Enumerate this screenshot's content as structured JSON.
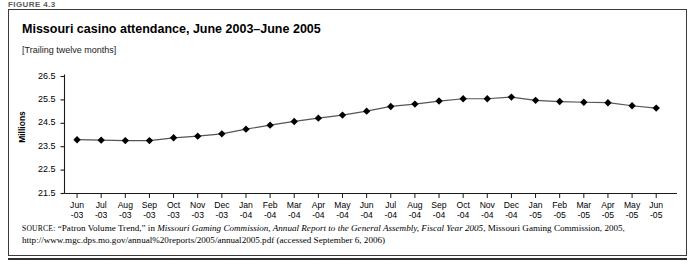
{
  "figure": {
    "label": "FIGURE 4.3"
  },
  "chart_header": {
    "title": "Missouri casino attendance, June 2003–June 2005",
    "subtitle": "[Trailing twelve months]"
  },
  "source": {
    "source_word": "SOURCE:",
    "part1": " “Patron Volume Trend,” in ",
    "italic1": "Missouri Gaming Commission, Annual Report to the General Assembly, Fiscal Year 2005",
    "part2": ", Missouri Gaming Commission, 2005, http://www.mgc.dps.mo.gov/annual%20reports/2005/annual2005.pdf (accessed September 6, 2006)"
  },
  "chart_data": {
    "type": "line",
    "title": "Missouri casino attendance, June 2003–June 2005",
    "subtitle": "[Trailing twelve months]",
    "xlabel": "",
    "ylabel": "Millions",
    "ylim": [
      21.5,
      26.5
    ],
    "yticks": [
      21.5,
      22.5,
      23.5,
      24.5,
      25.5,
      26.5
    ],
    "ytick_labels": [
      "21.5",
      "22.5",
      "23.5",
      "24.5",
      "25.5",
      "26.5"
    ],
    "grid": false,
    "legend": null,
    "marker": "diamond",
    "line_color": "#555555",
    "marker_color": "#000000",
    "categories": [
      "Jun -03",
      "Jul -03",
      "Aug -03",
      "Sep -03",
      "Oct -03",
      "Nov -03",
      "Dec -03",
      "Jan -04",
      "Feb -04",
      "Mar -04",
      "Apr -04",
      "May -04",
      "Jun -04",
      "Jul -04",
      "Aug -04",
      "Sep -04",
      "Oct -04",
      "Nov -04",
      "Dec -04",
      "Jan -05",
      "Feb -05",
      "Mar -05",
      "Apr -05",
      "May -05",
      "Jun -05"
    ],
    "xtick_months": [
      "Jun",
      "Jul",
      "Aug",
      "Sep",
      "Oct",
      "Nov",
      "Dec",
      "Jan",
      "Feb",
      "Mar",
      "Apr",
      "May",
      "Jun",
      "Jul",
      "Aug",
      "Sep",
      "Oct",
      "Nov",
      "Dec",
      "Jan",
      "Feb",
      "Mar",
      "Apr",
      "May",
      "Jun"
    ],
    "xtick_years": [
      "-03",
      "-03",
      "-03",
      "-03",
      "-03",
      "-03",
      "-03",
      "-04",
      "-04",
      "-04",
      "-04",
      "-04",
      "-04",
      "-04",
      "-04",
      "-04",
      "-04",
      "-04",
      "-04",
      "-05",
      "-05",
      "-05",
      "-05",
      "-05",
      "-05"
    ],
    "values": [
      23.8,
      23.78,
      23.76,
      23.76,
      23.88,
      23.95,
      24.05,
      24.25,
      24.42,
      24.58,
      24.72,
      24.85,
      25.02,
      25.22,
      25.32,
      25.45,
      25.55,
      25.55,
      25.62,
      25.48,
      25.43,
      25.4,
      25.38,
      25.25,
      25.15
    ]
  }
}
